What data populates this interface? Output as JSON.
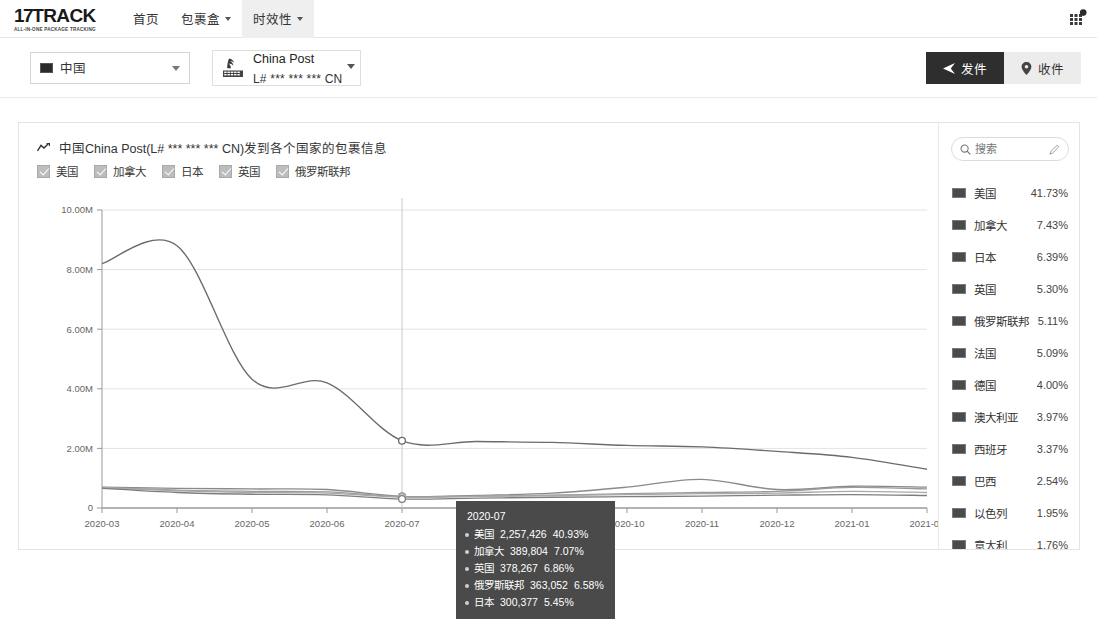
{
  "header": {
    "logo_main": "17TRACK",
    "logo_num": "17",
    "logo_word": "TRACK",
    "logo_sub": "ALL-IN-ONE PACKAGE TRACKING",
    "nav": [
      {
        "label": "首页",
        "has_caret": false,
        "active": false
      },
      {
        "label": "包裹盒",
        "has_caret": true,
        "active": false
      },
      {
        "label": "时效性",
        "has_caret": true,
        "active": true
      }
    ],
    "apps_icon": "apps-grid-icon"
  },
  "filterbar": {
    "country_select": {
      "value": "中国",
      "icon": "flag-icon"
    },
    "carrier_select": {
      "name": "China Post",
      "code": "L# *** *** *** CN",
      "icon": "china-post-logo"
    },
    "buttons": [
      {
        "label": "发件",
        "icon": "send-icon",
        "active": true
      },
      {
        "label": "收件",
        "icon": "location-pin-icon",
        "active": false
      }
    ]
  },
  "panel": {
    "title": "中国China Post(L# *** *** *** CN)发到各个国家的包裹信息",
    "title_icon": "trend-line-icon",
    "legend": [
      {
        "label": "美国",
        "checked": true
      },
      {
        "label": "加拿大",
        "checked": true
      },
      {
        "label": "日本",
        "checked": true
      },
      {
        "label": "英国",
        "checked": true
      },
      {
        "label": "俄罗斯联邦",
        "checked": true
      }
    ]
  },
  "tooltip": {
    "date": "2020-07",
    "rows": [
      {
        "name": "美国",
        "value": "2,257,426",
        "pct": "40.93%"
      },
      {
        "name": "加拿大",
        "value": "389,804",
        "pct": "7.07%"
      },
      {
        "name": "英国",
        "value": "378,267",
        "pct": "6.86%"
      },
      {
        "name": "俄罗斯联邦",
        "value": "363,052",
        "pct": "6.58%"
      },
      {
        "name": "日本",
        "value": "300,377",
        "pct": "5.45%"
      }
    ]
  },
  "sidebar": {
    "search": {
      "placeholder": "搜索",
      "value": "",
      "icon": "search-icon",
      "edit_icon": "pencil-icon"
    },
    "countries": [
      {
        "name": "美国",
        "pct": "41.73%",
        "flag": "us-flag"
      },
      {
        "name": "加拿大",
        "pct": "7.43%",
        "flag": "ca-flag"
      },
      {
        "name": "日本",
        "pct": "6.39%",
        "flag": "jp-flag"
      },
      {
        "name": "英国",
        "pct": "5.30%",
        "flag": "gb-flag"
      },
      {
        "name": "俄罗斯联邦",
        "pct": "5.11%",
        "flag": "ru-flag"
      },
      {
        "name": "法国",
        "pct": "5.09%",
        "flag": "fr-flag"
      },
      {
        "name": "德国",
        "pct": "4.00%",
        "flag": "de-flag"
      },
      {
        "name": "澳大利亚",
        "pct": "3.97%",
        "flag": "au-flag"
      },
      {
        "name": "西班牙",
        "pct": "3.37%",
        "flag": "es-flag"
      },
      {
        "name": "巴西",
        "pct": "2.54%",
        "flag": "br-flag"
      },
      {
        "name": "以色列",
        "pct": "1.95%",
        "flag": "il-flag"
      },
      {
        "name": "意大利",
        "pct": "1.76%",
        "flag": "it-flag"
      }
    ]
  },
  "chart_data": {
    "type": "line",
    "title": "中国China Post(L# *** *** *** CN)发到各个国家的包裹信息",
    "xlabel": "",
    "ylabel": "",
    "grid": true,
    "legend_position": "top-left",
    "x": [
      "2020-03",
      "2020-04",
      "2020-05",
      "2020-06",
      "2020-07",
      "2020-08",
      "2020-09",
      "2020-10",
      "2020-11",
      "2020-12",
      "2021-01",
      "2021-02"
    ],
    "ylim": [
      0,
      10000000
    ],
    "yticks": [
      0,
      2000000,
      4000000,
      6000000,
      8000000,
      10000000
    ],
    "ytick_labels": [
      "0",
      "2.00M",
      "4.00M",
      "6.00M",
      "8.00M",
      "10.00M"
    ],
    "highlight_x": "2020-07",
    "series": [
      {
        "name": "美国",
        "color": "#6b6b6b",
        "values": [
          8200000,
          8800000,
          4320000,
          4200000,
          2257426,
          2230000,
          2200000,
          2100000,
          2050000,
          1900000,
          1700000,
          1300000
        ]
      },
      {
        "name": "加拿大",
        "color": "#8a8a8a",
        "values": [
          700000,
          660000,
          640000,
          620000,
          389804,
          420000,
          500000,
          700000,
          960000,
          620000,
          730000,
          700000
        ]
      },
      {
        "name": "英国",
        "color": "#9a9a9a",
        "values": [
          690000,
          600000,
          560000,
          540000,
          378267,
          400000,
          430000,
          480000,
          520000,
          560000,
          690000,
          640000
        ]
      },
      {
        "name": "俄罗斯联邦",
        "color": "#a8a8a8",
        "values": [
          680000,
          580000,
          520000,
          500000,
          363052,
          390000,
          420000,
          450000,
          480000,
          500000,
          560000,
          520000
        ]
      },
      {
        "name": "日本",
        "color": "#7e7e7e",
        "values": [
          660000,
          520000,
          460000,
          440000,
          300377,
          330000,
          360000,
          380000,
          400000,
          430000,
          450000,
          420000
        ]
      }
    ]
  }
}
